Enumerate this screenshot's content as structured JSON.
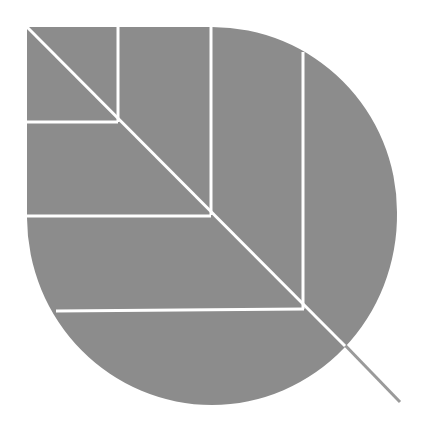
{
  "icon": {
    "name": "leaf-icon",
    "label": "Leaf",
    "fill_color": "#8c8c8c",
    "vein_color": "#ffffff",
    "stem_color": "#9a9a9a",
    "background": "#ffffff"
  }
}
